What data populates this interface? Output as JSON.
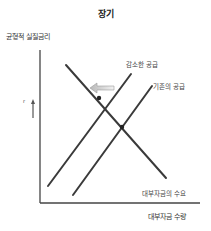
{
  "diagram": {
    "title": "장기",
    "y_axis_label": "균형적 실질금리",
    "x_axis_label": "대부자금 수량",
    "r_label": "r",
    "lines": [
      {
        "id": "reduced-supply",
        "label": "감소한 공급",
        "x1": 48,
        "y1": 186,
        "x2": 131,
        "y2": 74
      },
      {
        "id": "existing-supply",
        "label": "기존의 공급",
        "x1": 73,
        "y1": 195,
        "x2": 152,
        "y2": 86
      },
      {
        "id": "demand",
        "label": "대부자금의 수요",
        "x1": 66,
        "y1": 65,
        "x2": 166,
        "y2": 178
      }
    ],
    "shift_arrow": {
      "direction": "left",
      "from_x": 113,
      "to_x": 90,
      "y": 88
    },
    "equilibria": [
      {
        "x": 99,
        "y": 98,
        "label": "new"
      },
      {
        "x": 122,
        "y": 127,
        "label": "old"
      }
    ],
    "colors": {
      "line": "#3a3a3a",
      "axis": "#444444",
      "arrow_fill": "#d8d8d8",
      "arrow_stroke": "#9a9a9a"
    }
  }
}
